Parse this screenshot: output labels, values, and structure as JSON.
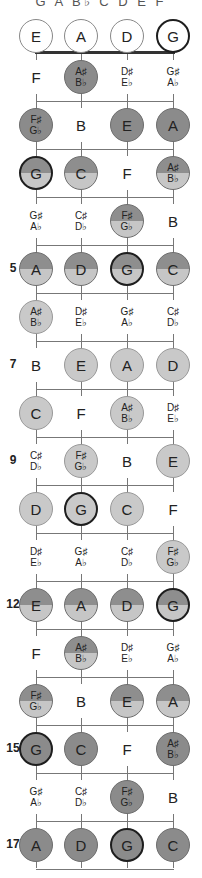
{
  "header": {
    "scale_notes": "G A B♭ C D E F"
  },
  "layout": {
    "string_x": [
      36,
      81,
      127,
      173
    ],
    "open_y": 36,
    "first_fret_y": 77,
    "fret_spacing": 48,
    "fret_count": 17
  },
  "colors": {
    "dark_fill": "#8b8b8b",
    "light_fill": "#c9c9c9",
    "split_top": "#8e8e8e",
    "split_bottom": "#c6c6c6",
    "root_border": "#1e1e1e",
    "line": "#777777"
  },
  "open_strings": [
    {
      "note": "E",
      "root": false
    },
    {
      "note": "A",
      "root": false
    },
    {
      "note": "D",
      "root": false
    },
    {
      "note": "G",
      "root": true
    }
  ],
  "frets": [
    {
      "fret": 1,
      "label": "",
      "fill": "dark",
      "cells": [
        {
          "n": [
            "F"
          ],
          "dot": false
        },
        {
          "n": [
            "A♯",
            "B♭"
          ],
          "dot": true
        },
        {
          "n": [
            "D♯",
            "E♭"
          ],
          "dot": false
        },
        {
          "n": [
            "G♯",
            "A♭"
          ],
          "dot": false
        }
      ]
    },
    {
      "fret": 2,
      "label": "",
      "fill": "dark",
      "cells": [
        {
          "n": [
            "F♯",
            "G♭"
          ],
          "dot": true
        },
        {
          "n": [
            "B"
          ],
          "dot": false
        },
        {
          "n": [
            "E"
          ],
          "dot": true
        },
        {
          "n": [
            "A"
          ],
          "dot": true
        }
      ]
    },
    {
      "fret": 3,
      "label": "",
      "fill": "split",
      "cells": [
        {
          "n": [
            "G"
          ],
          "dot": true,
          "root": true
        },
        {
          "n": [
            "C"
          ],
          "dot": true
        },
        {
          "n": [
            "F"
          ],
          "dot": false
        },
        {
          "n": [
            "A♯",
            "B♭"
          ],
          "dot": true
        }
      ]
    },
    {
      "fret": 4,
      "label": "",
      "fill": "split",
      "cells": [
        {
          "n": [
            "G♯",
            "A♭"
          ],
          "dot": false
        },
        {
          "n": [
            "C♯",
            "D♭"
          ],
          "dot": false
        },
        {
          "n": [
            "F♯",
            "G♭"
          ],
          "dot": true
        },
        {
          "n": [
            "B"
          ],
          "dot": false
        }
      ]
    },
    {
      "fret": 5,
      "label": "5",
      "fill": "split",
      "cells": [
        {
          "n": [
            "A"
          ],
          "dot": true
        },
        {
          "n": [
            "D"
          ],
          "dot": true
        },
        {
          "n": [
            "G"
          ],
          "dot": true,
          "root": true
        },
        {
          "n": [
            "C"
          ],
          "dot": true
        }
      ]
    },
    {
      "fret": 6,
      "label": "",
      "fill": "light",
      "cells": [
        {
          "n": [
            "A♯",
            "B♭"
          ],
          "dot": true
        },
        {
          "n": [
            "D♯",
            "E♭"
          ],
          "dot": false
        },
        {
          "n": [
            "G♯",
            "A♭"
          ],
          "dot": false
        },
        {
          "n": [
            "C♯",
            "D♭"
          ],
          "dot": false
        }
      ]
    },
    {
      "fret": 7,
      "label": "7",
      "fill": "light",
      "cells": [
        {
          "n": [
            "B"
          ],
          "dot": false
        },
        {
          "n": [
            "E"
          ],
          "dot": true
        },
        {
          "n": [
            "A"
          ],
          "dot": true
        },
        {
          "n": [
            "D"
          ],
          "dot": true
        }
      ]
    },
    {
      "fret": 8,
      "label": "",
      "fill": "light",
      "cells": [
        {
          "n": [
            "C"
          ],
          "dot": true
        },
        {
          "n": [
            "F"
          ],
          "dot": false
        },
        {
          "n": [
            "A♯",
            "B♭"
          ],
          "dot": true
        },
        {
          "n": [
            "D♯",
            "E♭"
          ],
          "dot": false
        }
      ]
    },
    {
      "fret": 9,
      "label": "9",
      "fill": "light",
      "cells": [
        {
          "n": [
            "C♯",
            "D♭"
          ],
          "dot": false
        },
        {
          "n": [
            "F♯",
            "G♭"
          ],
          "dot": true
        },
        {
          "n": [
            "B"
          ],
          "dot": false
        },
        {
          "n": [
            "E"
          ],
          "dot": true
        }
      ]
    },
    {
      "fret": 10,
      "label": "",
      "fill": "light",
      "cells": [
        {
          "n": [
            "D"
          ],
          "dot": true
        },
        {
          "n": [
            "G"
          ],
          "dot": true,
          "root": true
        },
        {
          "n": [
            "C"
          ],
          "dot": true
        },
        {
          "n": [
            "F"
          ],
          "dot": false
        }
      ]
    },
    {
      "fret": 11,
      "label": "",
      "fill": "light",
      "cells": [
        {
          "n": [
            "D♯",
            "E♭"
          ],
          "dot": false
        },
        {
          "n": [
            "G♯",
            "A♭"
          ],
          "dot": false
        },
        {
          "n": [
            "C♯",
            "D♭"
          ],
          "dot": false
        },
        {
          "n": [
            "F♯",
            "G♭"
          ],
          "dot": true
        }
      ]
    },
    {
      "fret": 12,
      "label": "12",
      "fill": "split",
      "cells": [
        {
          "n": [
            "E"
          ],
          "dot": true
        },
        {
          "n": [
            "A"
          ],
          "dot": true
        },
        {
          "n": [
            "D"
          ],
          "dot": true
        },
        {
          "n": [
            "G"
          ],
          "dot": true,
          "root": true
        }
      ]
    },
    {
      "fret": 13,
      "label": "",
      "fill": "split",
      "cells": [
        {
          "n": [
            "F"
          ],
          "dot": false
        },
        {
          "n": [
            "A♯",
            "B♭"
          ],
          "dot": true
        },
        {
          "n": [
            "D♯",
            "E♭"
          ],
          "dot": false
        },
        {
          "n": [
            "G♯",
            "A♭"
          ],
          "dot": false
        }
      ]
    },
    {
      "fret": 14,
      "label": "",
      "fill": "split",
      "cells": [
        {
          "n": [
            "F♯",
            "G♭"
          ],
          "dot": true
        },
        {
          "n": [
            "B"
          ],
          "dot": false
        },
        {
          "n": [
            "E"
          ],
          "dot": true
        },
        {
          "n": [
            "A"
          ],
          "dot": true
        }
      ]
    },
    {
      "fret": 15,
      "label": "15",
      "fill": "dark",
      "cells": [
        {
          "n": [
            "G"
          ],
          "dot": true,
          "root": true
        },
        {
          "n": [
            "C"
          ],
          "dot": true
        },
        {
          "n": [
            "F"
          ],
          "dot": false
        },
        {
          "n": [
            "A♯",
            "B♭"
          ],
          "dot": true
        }
      ]
    },
    {
      "fret": 16,
      "label": "",
      "fill": "dark",
      "cells": [
        {
          "n": [
            "G♯",
            "A♭"
          ],
          "dot": false
        },
        {
          "n": [
            "C♯",
            "D♭"
          ],
          "dot": false
        },
        {
          "n": [
            "F♯",
            "G♭"
          ],
          "dot": true
        },
        {
          "n": [
            "B"
          ],
          "dot": false
        }
      ]
    },
    {
      "fret": 17,
      "label": "17",
      "fill": "dark",
      "cells": [
        {
          "n": [
            "A"
          ],
          "dot": true
        },
        {
          "n": [
            "D"
          ],
          "dot": true
        },
        {
          "n": [
            "G"
          ],
          "dot": true,
          "root": true
        },
        {
          "n": [
            "C"
          ],
          "dot": true
        }
      ]
    }
  ]
}
